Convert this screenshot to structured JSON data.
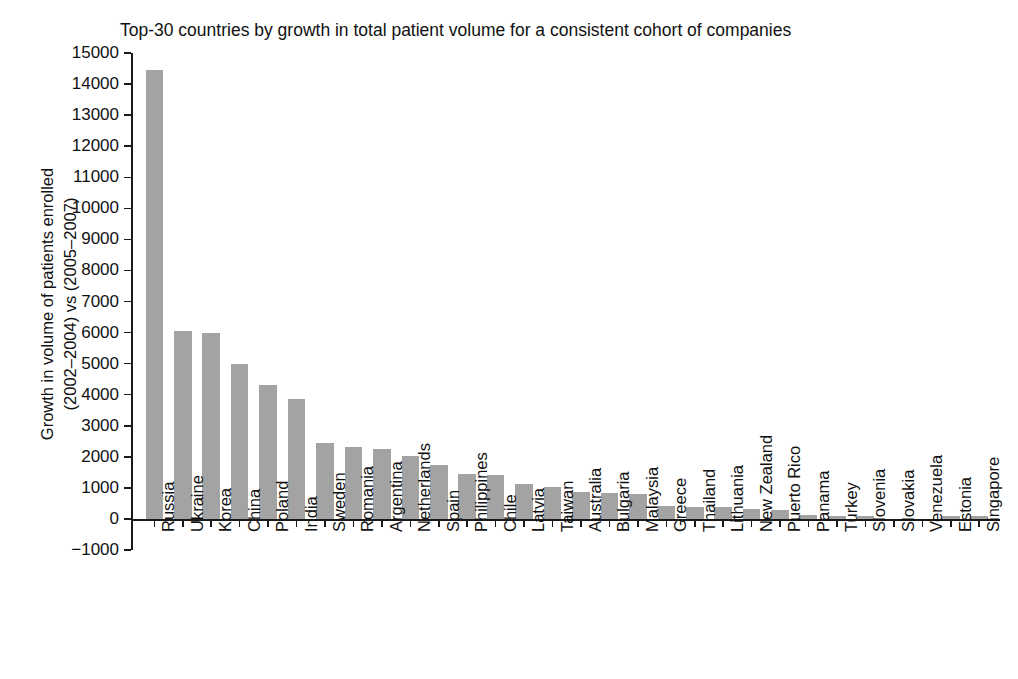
{
  "chart_data": {
    "type": "bar",
    "title": "Top-30 countries by growth in total patient volume for a consistent cohort of companies",
    "xlabel": "",
    "ylabel_lines": [
      "Growth in volume of patients enrolled",
      "(2002–2004) vs (2005–2007)"
    ],
    "ylabel": "Growth in volume of patients enrolled (2002–2004) vs (2005–2007)",
    "ylim": [
      -1000,
      15000
    ],
    "ytick_step": 1000,
    "ytick_labels": [
      "15000",
      "14000",
      "13000",
      "12000",
      "11000",
      "10000",
      "9000",
      "8000",
      "7000",
      "6000",
      "5000",
      "4000",
      "3000",
      "2000",
      "1000",
      "0",
      "−1000"
    ],
    "ytick_values": [
      15000,
      14000,
      13000,
      12000,
      11000,
      10000,
      9000,
      8000,
      7000,
      6000,
      5000,
      4000,
      3000,
      2000,
      1000,
      0,
      -1000
    ],
    "grid": false,
    "legend": null,
    "bar_color": "#a3a3a3",
    "categories": [
      "Russia",
      "Ukraine",
      "Korea",
      "China",
      "Poland",
      "India",
      "Sweden",
      "Romania",
      "Argentina",
      "Netherlands",
      "Spain",
      "Philippines",
      "Chile",
      "Latvia",
      "Taiwan",
      "Australia",
      "Bulgaria",
      "Malaysia",
      "Greece",
      "Thailand",
      "Lithuania",
      "New Zealand",
      "Puerto Rico",
      "Panama",
      "Turkey",
      "Slovenia",
      "Slovakia",
      "Venezuela",
      "Estonia",
      "Singapore"
    ],
    "values": [
      14450,
      6050,
      6000,
      5000,
      4300,
      3850,
      2450,
      2300,
      2250,
      2030,
      1750,
      1450,
      1400,
      1130,
      1020,
      880,
      840,
      800,
      430,
      400,
      390,
      320,
      290,
      120,
      110,
      110,
      0,
      0,
      80,
      80
    ]
  }
}
